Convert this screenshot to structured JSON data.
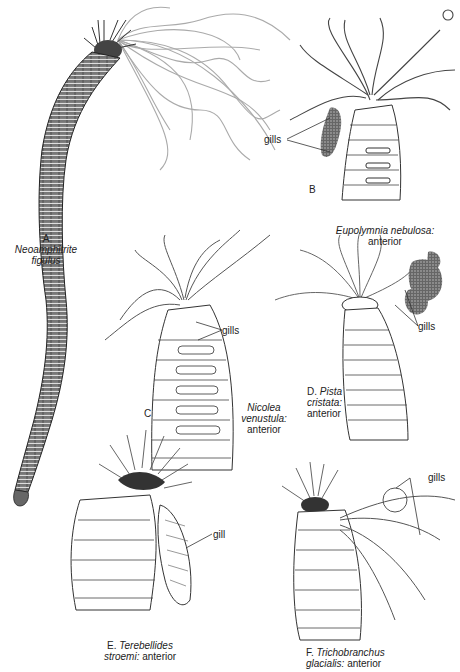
{
  "plate": {
    "background": "#ffffff",
    "ink_color": "#222222",
    "gill_color": "#555555",
    "tentacle_color": "#999999"
  },
  "figures": [
    {
      "id": "A",
      "letter": "A",
      "genus": "Neoamphitrite",
      "species": "figulus",
      "qualifier": "",
      "pointer_labels": []
    },
    {
      "id": "B",
      "letter": "B",
      "genus": "Eupolymnia",
      "species": "nebulosa:",
      "qualifier": "anterior",
      "pointer_labels": [
        "gills"
      ]
    },
    {
      "id": "C",
      "letter": "C",
      "genus": "Nicolea",
      "species": "venustula:",
      "qualifier": "anterior",
      "pointer_labels": [
        "gills"
      ]
    },
    {
      "id": "D",
      "letter": "D.",
      "genus": "Pista",
      "species": "cristata:",
      "qualifier": "anterior",
      "pointer_labels": [
        "gills"
      ]
    },
    {
      "id": "E",
      "letter": "E.",
      "genus": "Terebellides",
      "species": "stroemi:",
      "qualifier": "anterior",
      "pointer_labels": [
        "gill"
      ]
    },
    {
      "id": "F",
      "letter": "F.",
      "genus": "Trichobranchus",
      "species": "glacialis:",
      "qualifier": "anterior",
      "pointer_labels": [
        "gills"
      ]
    }
  ]
}
